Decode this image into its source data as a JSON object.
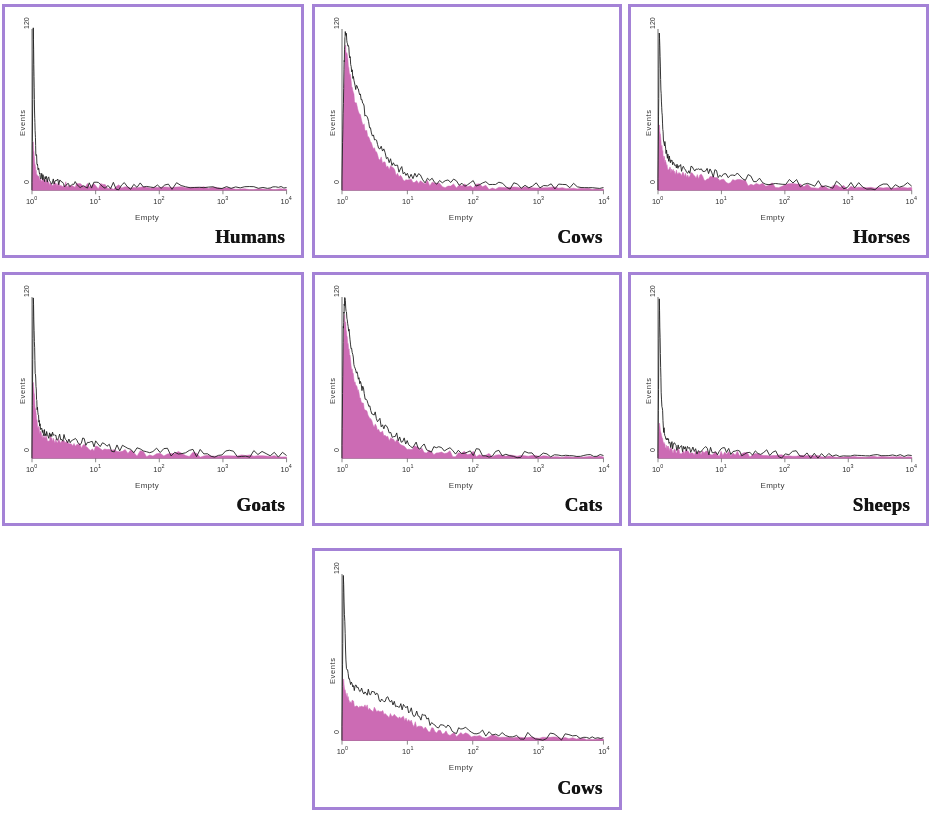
{
  "figure": {
    "background_color": "#ffffff",
    "panel_border_color": "#a482d6",
    "fill_color": "#cc6bb4",
    "outline_color": "#1f1f1f"
  },
  "axis": {
    "y_top_label": "120",
    "y_bottom_label": "0",
    "y_axis_title": "Events",
    "x_axis_title": "Empty",
    "x_tick_bases": [
      "10",
      "10",
      "10",
      "10",
      "10"
    ],
    "x_tick_exponents": [
      "0",
      "1",
      "2",
      "3",
      "4"
    ]
  },
  "chart_data": {
    "type": "line",
    "title": "",
    "xlabel": "Empty",
    "ylabel": "Events",
    "xscale": "log",
    "xlim": [
      1,
      10000
    ],
    "xtick_labels": [
      "10^0",
      "10^1",
      "10^2",
      "10^3",
      "10^4"
    ],
    "ylim": [
      0,
      120
    ],
    "ytick_labels": [
      "0",
      "120"
    ],
    "grid": false,
    "legend": false,
    "panels": [
      {
        "name": "Humans",
        "row": 1,
        "col": 1,
        "peak_events": 120,
        "peak_x_decade": 0.02,
        "series": [
          {
            "name": "outline",
            "color": "#1f1f1f",
            "x_decades": [
              0.0,
              0.02,
              0.04,
              0.06,
              0.09,
              0.13,
              0.18,
              0.24,
              0.32,
              0.42,
              0.55,
              0.7,
              0.9,
              1.15,
              1.45,
              1.8,
              2.2,
              2.7,
              3.2,
              3.7,
              4.0
            ],
            "values": [
              4,
              120,
              60,
              28,
              16,
              11,
              9,
              8,
              7,
              6,
              5,
              5,
              4,
              4,
              3,
              3,
              3,
              2,
              2,
              2,
              2
            ]
          },
          {
            "name": "fill",
            "color": "#cc6bb4",
            "x_decades": [
              0.0,
              0.02,
              0.04,
              0.06,
              0.09,
              0.13,
              0.18,
              0.24,
              0.32,
              0.42,
              0.55,
              0.7,
              0.9,
              1.15,
              1.45,
              1.8,
              2.2,
              2.7,
              3.2,
              3.7,
              4.0
            ],
            "values": [
              3,
              34,
              22,
              14,
              10,
              8,
              7,
              6,
              5,
              5,
              4,
              4,
              3,
              3,
              2,
              2,
              2,
              2,
              1,
              1,
              1
            ]
          }
        ]
      },
      {
        "name": "Cows",
        "row": 1,
        "col": 2,
        "peak_events": 120,
        "peak_x_decade": 0.05,
        "series": [
          {
            "name": "outline",
            "color": "#1f1f1f",
            "x_decades": [
              0.0,
              0.03,
              0.05,
              0.09,
              0.14,
              0.2,
              0.27,
              0.35,
              0.45,
              0.56,
              0.7,
              0.85,
              1.0,
              1.2,
              1.45,
              1.75,
              2.05,
              2.4,
              2.8,
              3.2,
              3.6,
              4.0
            ],
            "values": [
              10,
              90,
              120,
              108,
              92,
              78,
              72,
              58,
              44,
              33,
              24,
              17,
              12,
              9,
              7,
              6,
              5,
              4,
              3,
              3,
              2,
              2
            ]
          },
          {
            "name": "fill",
            "color": "#cc6bb4",
            "x_decades": [
              0.0,
              0.03,
              0.05,
              0.09,
              0.14,
              0.2,
              0.27,
              0.35,
              0.45,
              0.56,
              0.7,
              0.85,
              1.0,
              1.2,
              1.45,
              1.75,
              2.05,
              2.4,
              2.8,
              3.2,
              3.6,
              4.0
            ],
            "values": [
              8,
              76,
              108,
              96,
              80,
              66,
              58,
              46,
              34,
              25,
              18,
              12,
              8,
              6,
              4,
              3,
              3,
              2,
              2,
              2,
              1,
              1
            ]
          }
        ]
      },
      {
        "name": "Horses",
        "row": 1,
        "col": 3,
        "peak_events": 120,
        "peak_x_decade": 0.02,
        "series": [
          {
            "name": "outline",
            "color": "#1f1f1f",
            "x_decades": [
              0.0,
              0.02,
              0.05,
              0.08,
              0.12,
              0.17,
              0.23,
              0.3,
              0.4,
              0.52,
              0.66,
              0.82,
              1.0,
              1.25,
              1.55,
              1.9,
              2.3,
              2.7,
              3.1,
              3.55,
              4.0
            ],
            "values": [
              6,
              120,
              70,
              42,
              30,
              24,
              20,
              18,
              16,
              15,
              14,
              13,
              12,
              10,
              8,
              6,
              5,
              4,
              4,
              3,
              3
            ]
          },
          {
            "name": "fill",
            "color": "#cc6bb4",
            "x_decades": [
              0.0,
              0.02,
              0.05,
              0.08,
              0.12,
              0.17,
              0.23,
              0.3,
              0.4,
              0.52,
              0.66,
              0.82,
              1.0,
              1.25,
              1.55,
              1.9,
              2.3,
              2.7,
              3.1,
              3.55,
              4.0
            ],
            "values": [
              5,
              50,
              36,
              26,
              20,
              16,
              14,
              13,
              12,
              11,
              10,
              9,
              8,
              6,
              5,
              4,
              3,
              3,
              2,
              2,
              2
            ]
          }
        ]
      },
      {
        "name": "Goats",
        "row": 2,
        "col": 1,
        "peak_events": 120,
        "peak_x_decade": 0.02,
        "series": [
          {
            "name": "outline",
            "color": "#1f1f1f",
            "x_decades": [
              0.0,
              0.02,
              0.05,
              0.08,
              0.12,
              0.17,
              0.23,
              0.31,
              0.4,
              0.52,
              0.66,
              0.82,
              1.0,
              1.25,
              1.55,
              1.9,
              2.3,
              2.7,
              3.1,
              3.55,
              4.0
            ],
            "values": [
              6,
              120,
              66,
              38,
              26,
              20,
              18,
              17,
              16,
              15,
              13,
              12,
              10,
              8,
              6,
              5,
              4,
              4,
              3,
              3,
              2
            ]
          },
          {
            "name": "fill",
            "color": "#cc6bb4",
            "x_decades": [
              0.0,
              0.02,
              0.05,
              0.08,
              0.12,
              0.17,
              0.23,
              0.31,
              0.4,
              0.52,
              0.66,
              0.82,
              1.0,
              1.25,
              1.55,
              1.9,
              2.3,
              2.7,
              3.1,
              3.55,
              4.0
            ],
            "values": [
              5,
              58,
              38,
              26,
              20,
              16,
              15,
              14,
              13,
              12,
              10,
              9,
              7,
              5,
              4,
              3,
              3,
              2,
              2,
              2,
              1
            ]
          }
        ]
      },
      {
        "name": "Cats",
        "row": 2,
        "col": 2,
        "peak_events": 120,
        "peak_x_decade": 0.04,
        "series": [
          {
            "name": "outline",
            "color": "#1f1f1f",
            "x_decades": [
              0.0,
              0.02,
              0.04,
              0.08,
              0.13,
              0.19,
              0.26,
              0.34,
              0.44,
              0.56,
              0.7,
              0.86,
              1.02,
              1.22,
              1.48,
              1.78,
              2.1,
              2.45,
              2.85,
              3.25,
              3.65,
              4.0
            ],
            "values": [
              8,
              96,
              120,
              104,
              86,
              70,
              60,
              48,
              37,
              28,
              21,
              15,
              11,
              8,
              6,
              5,
              4,
              3,
              3,
              2,
              2,
              2
            ]
          },
          {
            "name": "fill",
            "color": "#cc6bb4",
            "x_decades": [
              0.0,
              0.02,
              0.04,
              0.08,
              0.13,
              0.19,
              0.26,
              0.34,
              0.44,
              0.56,
              0.7,
              0.86,
              1.02,
              1.22,
              1.48,
              1.78,
              2.1,
              2.45,
              2.85,
              3.25,
              3.65,
              4.0
            ],
            "values": [
              7,
              80,
              106,
              90,
              72,
              58,
              48,
              38,
              28,
              21,
              15,
              11,
              8,
              6,
              4,
              3,
              3,
              2,
              2,
              1,
              1,
              1
            ]
          }
        ]
      },
      {
        "name": "Sheeps",
        "row": 2,
        "col": 3,
        "peak_events": 120,
        "peak_x_decade": 0.02,
        "series": [
          {
            "name": "outline",
            "color": "#1f1f1f",
            "x_decades": [
              0.0,
              0.02,
              0.05,
              0.09,
              0.13,
              0.18,
              0.25,
              0.33,
              0.43,
              0.55,
              0.7,
              0.88,
              1.08,
              1.32,
              1.62,
              1.95,
              2.35,
              2.75,
              3.15,
              3.58,
              4.0
            ],
            "values": [
              4,
              120,
              48,
              22,
              14,
              11,
              9,
              8,
              7,
              6,
              6,
              5,
              5,
              4,
              4,
              3,
              3,
              2,
              2,
              2,
              2
            ]
          },
          {
            "name": "fill",
            "color": "#cc6bb4",
            "x_decades": [
              0.0,
              0.02,
              0.05,
              0.09,
              0.13,
              0.18,
              0.25,
              0.33,
              0.43,
              0.55,
              0.7,
              0.88,
              1.08,
              1.32,
              1.62,
              1.95,
              2.35,
              2.75,
              3.15,
              3.58,
              4.0
            ],
            "values": [
              3,
              26,
              17,
              11,
              8,
              7,
              6,
              5,
              5,
              4,
              4,
              3,
              3,
              3,
              2,
              2,
              2,
              1,
              1,
              1,
              1
            ]
          }
        ]
      },
      {
        "name": "Cows",
        "row": 3,
        "col": 2,
        "peak_events": 120,
        "peak_x_decade": 0.02,
        "series": [
          {
            "name": "outline",
            "color": "#1f1f1f",
            "x_decades": [
              0.0,
              0.02,
              0.06,
              0.12,
              0.2,
              0.3,
              0.42,
              0.55,
              0.68,
              0.82,
              0.96,
              1.1,
              1.25,
              1.42,
              1.62,
              1.85,
              2.15,
              2.5,
              2.9,
              3.3,
              3.7,
              4.0
            ],
            "values": [
              8,
              120,
              56,
              42,
              38,
              36,
              34,
              31,
              29,
              26,
              23,
              20,
              16,
              12,
              9,
              7,
              5,
              4,
              3,
              3,
              2,
              2
            ]
          },
          {
            "name": "fill",
            "color": "#cc6bb4",
            "x_decades": [
              0.0,
              0.02,
              0.06,
              0.12,
              0.2,
              0.3,
              0.42,
              0.55,
              0.68,
              0.82,
              0.96,
              1.1,
              1.25,
              1.42,
              1.62,
              1.85,
              2.15,
              2.5,
              2.9,
              3.3,
              3.7,
              4.0
            ],
            "values": [
              6,
              44,
              34,
              28,
              26,
              25,
              23,
              21,
              19,
              17,
              15,
              12,
              9,
              7,
              5,
              4,
              3,
              2,
              2,
              2,
              1,
              1
            ]
          }
        ]
      }
    ]
  },
  "panels": [
    {
      "caption": "Humans"
    },
    {
      "caption": "Cows"
    },
    {
      "caption": "Horses"
    },
    {
      "caption": "Goats"
    },
    {
      "caption": "Cats"
    },
    {
      "caption": "Sheeps"
    },
    {
      "caption": "Cows"
    }
  ]
}
